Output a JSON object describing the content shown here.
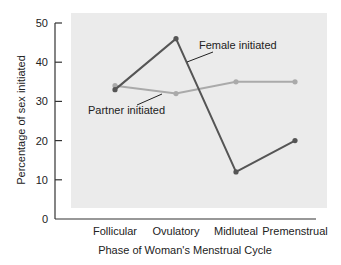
{
  "chart_data": {
    "type": "line",
    "title": "",
    "xlabel": "Phase of Woman's Menstrual Cycle",
    "ylabel": "Percentage of sex initiated",
    "categories": [
      "Follicular",
      "Ovulatory",
      "Midluteal",
      "Premenstrual"
    ],
    "ylim": [
      0,
      50
    ],
    "yticks": [
      0,
      10,
      20,
      30,
      40,
      50
    ],
    "grid": false,
    "legend": "inline annotations",
    "series": [
      {
        "name": "Female initiated",
        "color": "#555555",
        "values": [
          33,
          46,
          12,
          20
        ]
      },
      {
        "name": "Partner initiated",
        "color": "#aaaaaa",
        "values": [
          34,
          32,
          35,
          35
        ]
      }
    ]
  },
  "colors": {
    "plot_background": "#ebebeb",
    "axis": "#333333"
  }
}
